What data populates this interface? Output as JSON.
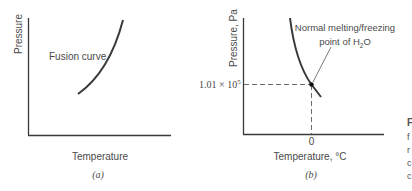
{
  "panel_a": {
    "y_label": "Pressure",
    "x_label": "Temperature",
    "curve_label": "Fusion curve",
    "caption": "(a)"
  },
  "panel_b": {
    "y_label": "Pressure, Pa",
    "x_label": "Temperature, °C",
    "annotation_line1": "Normal melting/freezing",
    "annotation_line2_prefix": "point of H",
    "annotation_line2_sub": "2",
    "annotation_line2_suffix": "O",
    "y_tick_mantissa": "1.01 × 10",
    "y_tick_exponent": "5",
    "x_tick": "0",
    "caption": "(b)"
  },
  "cropped_margin_text": [
    "F",
    "f",
    "r",
    "c",
    "c"
  ],
  "colors": {
    "axis": "#3a3a3a",
    "curve": "#3a3a3a",
    "text": "#4a4a4a",
    "dashed": "#5a5a5a"
  }
}
